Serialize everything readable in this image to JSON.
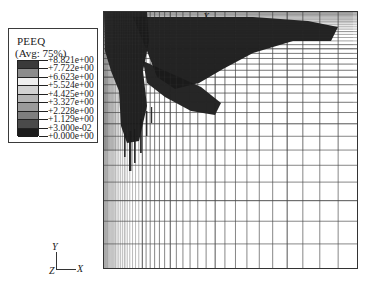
{
  "legend": {
    "title": "PEEQ",
    "subtitle": "(Avg: 75%)",
    "labels": [
      "+8.821e+00",
      "+7.722e+00",
      "+6.623e+00",
      "+5.524e+00",
      "+4.425e+00",
      "+3.327e+00",
      "+2.228e+00",
      "+1.129e+00",
      "+3.000e-02",
      "+0.000e+00"
    ],
    "swatch_colors": [
      "#3a3a3a",
      "#8c8c8c",
      "#efefef",
      "#d2d2d2",
      "#b4b4b4",
      "#9a9a9a",
      "#7e7e7e",
      "#4a4a4a",
      "#1c1c1c"
    ]
  },
  "triad": {
    "x_label": "X",
    "y_label": "Y",
    "z_label": "Z"
  },
  "mesh": {
    "corner_label": "X",
    "line_color": "#4a4a4a",
    "band_color": "#1a1a1a"
  },
  "chart_data": {
    "type": "heatmap",
    "title": "PEEQ",
    "subtitle": "(Avg: 75%)",
    "xlabel": "X",
    "ylabel": "Y",
    "legend_position": "left",
    "grid": true,
    "colorbar": {
      "orientation": "vertical",
      "scale": "grayscale",
      "tick_values": [
        8.821,
        7.722,
        6.623,
        5.524,
        4.425,
        3.327,
        2.228,
        1.129,
        0.03,
        0.0
      ],
      "tick_labels": [
        "+8.821e+00",
        "+7.722e+00",
        "+6.623e+00",
        "+5.524e+00",
        "+4.425e+00",
        "+3.327e+00",
        "+2.228e+00",
        "+1.129e+00",
        "+3.000e-02",
        "+0.000e+00"
      ],
      "vmin": 0.0,
      "vmax": 8.821,
      "band_count": 9
    },
    "mesh_grid": {
      "description": "Graded quadrilateral finite-element mesh, refined toward the upper-left corner",
      "x_columns": 46,
      "y_rows": 38,
      "x_grading": "geometric, fine at left edge coarsening to the right",
      "y_grading": "geometric, fine at top edge coarsening downward"
    },
    "contour_regions": [
      {
        "name": "high-strain-shear-band",
        "value_range": [
          3.0,
          8.821
        ],
        "location": "upper-left corner, V-shaped band extending right and down"
      },
      {
        "name": "undeformed-bulk",
        "value_range": [
          0.0,
          0.03
        ],
        "location": "remainder of domain"
      }
    ]
  }
}
